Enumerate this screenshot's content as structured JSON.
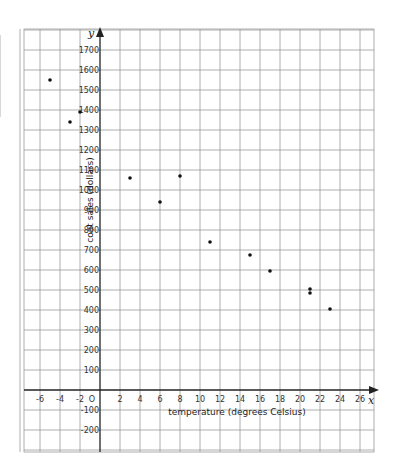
{
  "chart_data": {
    "type": "scatter",
    "title": "",
    "xlabel": "temperature (degrees Celsius)",
    "ylabel": "coat sales (dollars)",
    "x_var": "x",
    "y_var": "y",
    "xlim": [
      -8,
      27
    ],
    "ylim": [
      -300,
      1800
    ],
    "x_grid_step": 2,
    "y_grid_step": 100,
    "grid": true,
    "origin_label": "O",
    "x_ticks": [
      -6,
      -4,
      -2,
      2,
      4,
      6,
      8,
      10,
      12,
      14,
      16,
      18,
      20,
      22,
      24,
      26
    ],
    "y_ticks": [
      -200,
      -100,
      100,
      200,
      300,
      400,
      500,
      600,
      700,
      800,
      900,
      1000,
      1100,
      1200,
      1300,
      1400,
      1500,
      1600,
      1700
    ],
    "points": [
      {
        "x": -5,
        "y": 1550
      },
      {
        "x": -3,
        "y": 1340
      },
      {
        "x": -2,
        "y": 1390
      },
      {
        "x": 3,
        "y": 1060
      },
      {
        "x": 6,
        "y": 940
      },
      {
        "x": 8,
        "y": 1070
      },
      {
        "x": 11,
        "y": 740
      },
      {
        "x": 15,
        "y": 675
      },
      {
        "x": 17,
        "y": 595
      },
      {
        "x": 21,
        "y": 505
      },
      {
        "x": 21,
        "y": 485
      },
      {
        "x": 23,
        "y": 405
      }
    ]
  }
}
